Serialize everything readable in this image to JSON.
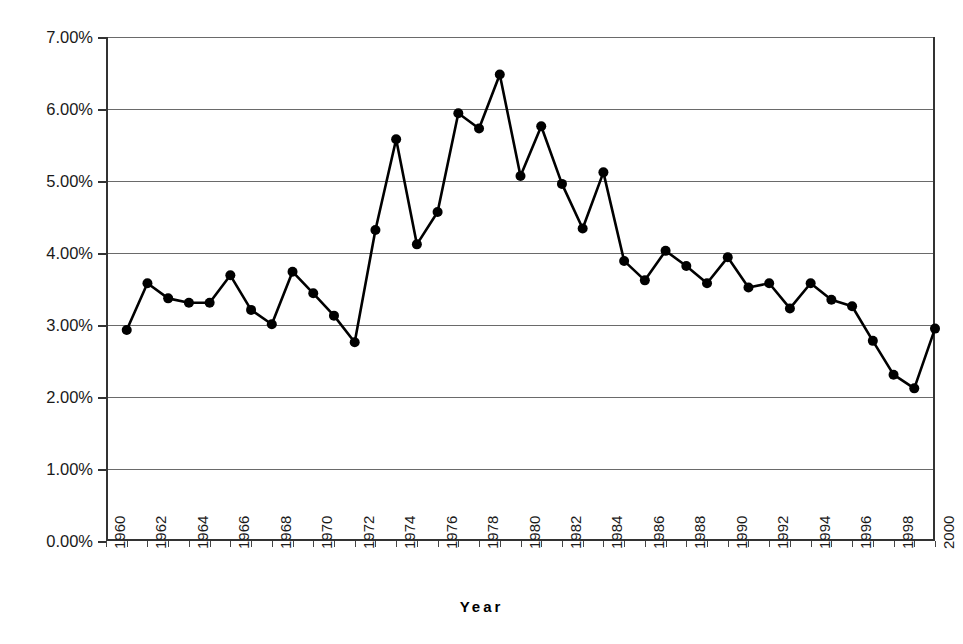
{
  "chart_data": {
    "type": "line",
    "title": "",
    "xlabel": "Year",
    "ylabel": "",
    "xlim": [
      1960,
      2000
    ],
    "ylim": [
      0.0,
      7.0
    ],
    "grid": true,
    "legend": false,
    "y_tick_labels": [
      "7.00%",
      "6.00%",
      "5.00%",
      "4.00%",
      "3.00%",
      "2.00%",
      "1.00%",
      "0.00%"
    ],
    "y_tick_values": [
      7.0,
      6.0,
      5.0,
      4.0,
      3.0,
      2.0,
      1.0,
      0.0
    ],
    "x_tick_labels": [
      "1960",
      "1962",
      "1964",
      "1966",
      "1968",
      "1970",
      "1972",
      "1974",
      "1976",
      "1978",
      "1980",
      "1982",
      "1984",
      "1986",
      "1988",
      "1990",
      "1992",
      "1994",
      "1996",
      "1998",
      "2000"
    ],
    "x_tick_values": [
      1960,
      1962,
      1964,
      1966,
      1968,
      1970,
      1972,
      1974,
      1976,
      1978,
      1980,
      1982,
      1984,
      1986,
      1988,
      1990,
      1992,
      1994,
      1996,
      1998,
      2000
    ],
    "series": [
      {
        "name": "value",
        "marker": "filled-circle",
        "color": "#000000",
        "x": [
          1961,
          1962,
          1963,
          1964,
          1965,
          1966,
          1967,
          1968,
          1969,
          1970,
          1971,
          1972,
          1973,
          1974,
          1975,
          1976,
          1977,
          1978,
          1979,
          1980,
          1981,
          1982,
          1983,
          1984,
          1985,
          1986,
          1987,
          1988,
          1989,
          1990,
          1991,
          1992,
          1993,
          1994,
          1995,
          1996,
          1997,
          1998,
          1999,
          2000
        ],
        "values": [
          2.93,
          3.58,
          3.37,
          3.31,
          3.31,
          3.69,
          3.21,
          3.01,
          3.74,
          3.44,
          3.13,
          2.76,
          4.32,
          5.58,
          4.12,
          4.57,
          5.94,
          5.73,
          6.48,
          5.07,
          5.76,
          4.96,
          4.34,
          5.12,
          3.89,
          3.62,
          4.03,
          3.82,
          3.58,
          3.94,
          3.52,
          3.58,
          3.23,
          3.58,
          3.35,
          3.26,
          2.78,
          2.31,
          2.12,
          2.95
        ]
      }
    ],
    "units": "percent"
  }
}
